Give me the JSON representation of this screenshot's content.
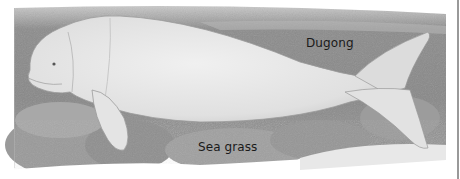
{
  "illustration": {
    "subject": "dugong",
    "style": "grayscale drawing",
    "labels": {
      "animal": "Dugong",
      "habitat": "Sea grass"
    }
  },
  "colors": {
    "background": "#ffffff",
    "water": "#8a8a8a",
    "body": "#e6e6e6",
    "seagrass": "#a5a5a5",
    "text": "#1a1a1a"
  }
}
